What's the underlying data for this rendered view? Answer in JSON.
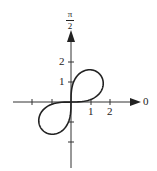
{
  "diagram": {
    "type": "polar-plot",
    "curve": "lemniscate",
    "equation_hint": "r^2 = 4 sin 2θ",
    "axis_labels": {
      "polar_axis": "0",
      "vertical_axis_top": "π",
      "vertical_axis_bottom": "2"
    },
    "x_tick_labels": [
      "1",
      "2"
    ],
    "y_tick_labels": [
      "1",
      "2"
    ],
    "colors": {
      "stroke": "#222222",
      "background": "#ffffff"
    }
  }
}
